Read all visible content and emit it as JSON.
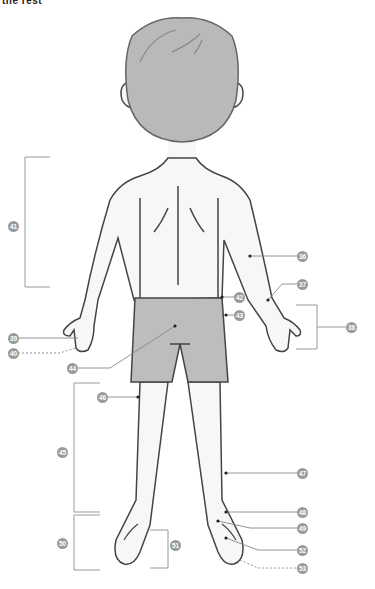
{
  "header": {
    "partial_text": "the rest"
  },
  "diagram": {
    "colors": {
      "hair": "#b9b9b9",
      "skin": "#f7f7f7",
      "shorts": "#bdbdbd",
      "outline": "#444444",
      "leader": "#888888",
      "label_bg": "#9a9a9a"
    },
    "labels": [
      {
        "id": "36",
        "x": 302,
        "y": 256
      },
      {
        "id": "37",
        "x": 302,
        "y": 284
      },
      {
        "id": "38",
        "x": 351,
        "y": 327
      },
      {
        "id": "39",
        "x": 13,
        "y": 338
      },
      {
        "id": "40",
        "x": 13,
        "y": 353
      },
      {
        "id": "41",
        "x": 13,
        "y": 226
      },
      {
        "id": "42",
        "x": 239,
        "y": 297
      },
      {
        "id": "43",
        "x": 239,
        "y": 315
      },
      {
        "id": "44",
        "x": 72,
        "y": 368
      },
      {
        "id": "45",
        "x": 62,
        "y": 452
      },
      {
        "id": "46",
        "x": 102,
        "y": 397
      },
      {
        "id": "47",
        "x": 302,
        "y": 473
      },
      {
        "id": "48",
        "x": 302,
        "y": 512
      },
      {
        "id": "49",
        "x": 302,
        "y": 528
      },
      {
        "id": "50",
        "x": 62,
        "y": 543
      },
      {
        "id": "51",
        "x": 175,
        "y": 545
      },
      {
        "id": "52",
        "x": 302,
        "y": 550
      },
      {
        "id": "53",
        "x": 302,
        "y": 568
      }
    ]
  }
}
